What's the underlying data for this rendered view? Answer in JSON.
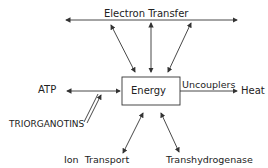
{
  "diagram": {
    "center": "Energy",
    "top": "Electron   Transfer",
    "left": "ATP",
    "inhibitor": "TRIORGANOTINS",
    "right_label": "Uncouplers",
    "right": "Heat",
    "bottom_left": "Ion  Transport",
    "bottom_right": "Transhydrogenase"
  },
  "colors": {
    "line": "#333333",
    "background": "#ffffff"
  }
}
